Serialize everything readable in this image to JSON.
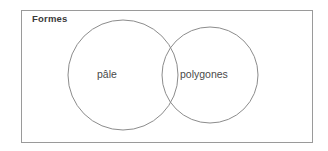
{
  "figure": {
    "name": "venn-diagram",
    "type": "venn",
    "universe": {
      "label": "Formes",
      "border_color": "#9a9a9a",
      "background": "#ffffff"
    },
    "sets": [
      {
        "id": "left",
        "label": "pâle",
        "cx": 123,
        "cy": 75,
        "r": 55,
        "stroke": "#8c8c8c"
      },
      {
        "id": "right",
        "label": "polygones",
        "cx": 210,
        "cy": 75,
        "r": 48,
        "stroke": "#8c8c8c"
      }
    ],
    "text_color": "#4a4a4a",
    "title_color": "#3a3a3a"
  }
}
